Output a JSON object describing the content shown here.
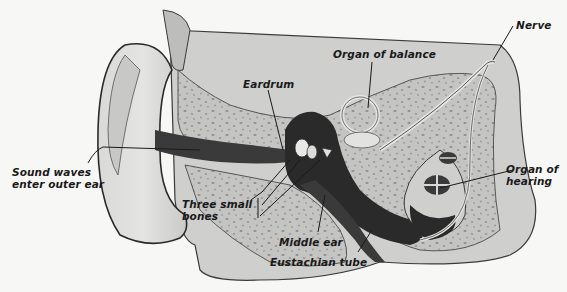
{
  "figure": {
    "colors": {
      "background": "#f7f7f5",
      "tissue": "#cfcfcd",
      "tissue_light": "#dcdcda",
      "bone": "#bdbdbb",
      "bone_speckle": "#8e8e8c",
      "canal_dark": "#2a2a2a",
      "outline": "#3a3a3a",
      "label": "#1a1a1a"
    }
  },
  "labels": {
    "sound_waves": "Sound waves\nenter outer ear",
    "eardrum": "Eardrum",
    "organ_of_balance": "Organ of balance",
    "nerve": "Nerve",
    "organ_of_hearing": "Organ of\nhearing",
    "three_small_bones": "Three small\nbones",
    "middle_ear": "Middle ear",
    "eustachian_tube": "Eustachian tube"
  }
}
